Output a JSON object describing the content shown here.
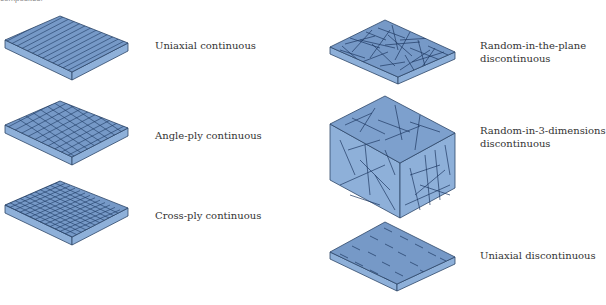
{
  "caption_fragment": "composites:",
  "colors": {
    "top_face": "#7699c7",
    "side_face": "#8eb0d9",
    "edge": "#2d4668",
    "fiber": "#1f3a63",
    "label_text": "#333333"
  },
  "panels": [
    {
      "id": "uniaxial-continuous",
      "label_lines": [
        "Uniaxial continuous"
      ],
      "fiber_pattern": "parallel-lines"
    },
    {
      "id": "angle-ply-continuous",
      "label_lines": [
        "Angle-ply continuous"
      ],
      "fiber_pattern": "diagonal-crosshatch"
    },
    {
      "id": "cross-ply-continuous",
      "label_lines": [
        "Cross-ply continuous"
      ],
      "fiber_pattern": "orthogonal-grid"
    },
    {
      "id": "random-in-the-plane-discontinuous",
      "label_lines": [
        "Random-in-the-plane",
        "discontinuous"
      ],
      "fiber_pattern": "random-short-planar"
    },
    {
      "id": "random-in-3-dimensions-discontinuous",
      "label_lines": [
        "Random-in-3-dimensions",
        "discontinuous"
      ],
      "fiber_pattern": "random-short-3d"
    },
    {
      "id": "uniaxial-discontinuous",
      "label_lines": [
        "Uniaxial discontinuous"
      ],
      "fiber_pattern": "aligned-short-dashes"
    }
  ]
}
